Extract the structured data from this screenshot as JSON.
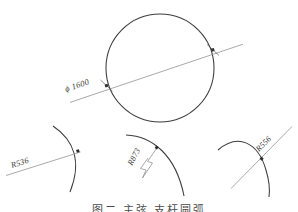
{
  "drawing": {
    "title_caption": "图二  主弦  支杆圆弧",
    "stroke_color": "#3d3d3d",
    "dim_line_color": "#8c8c8c",
    "text_color": "#3a3a3a",
    "background": "#ffffff"
  },
  "circle_figure": {
    "name": "main-circle",
    "dimension_label": "ϕ 1600",
    "value": 1600,
    "symbol": "ϕ",
    "center": {
      "x": 160,
      "y": 68
    },
    "radius": 54,
    "dim_line": {
      "x1": 70,
      "y1": 102,
      "x2": 243,
      "y2": 44
    }
  },
  "arcs": [
    {
      "name": "arc-left",
      "label": "R536",
      "radius_value": 536,
      "leader": {
        "x1": 8,
        "y1": 174,
        "x2": 80,
        "y2": 152
      },
      "label_pos": {
        "x": 13,
        "y": 163,
        "rotate": -17
      }
    },
    {
      "name": "arc-middle",
      "label": "R873",
      "radius_value": 873,
      "leader_type": "zigzag",
      "label_pos": {
        "x": 131,
        "y": 160,
        "rotate": -62
      }
    },
    {
      "name": "arc-right",
      "label": "R556",
      "radius_value": 556,
      "leader": {
        "x1": 232,
        "y1": 187,
        "x2": 291,
        "y2": 127
      },
      "label_pos": {
        "x": 262,
        "y": 148,
        "rotate": -45
      }
    }
  ]
}
